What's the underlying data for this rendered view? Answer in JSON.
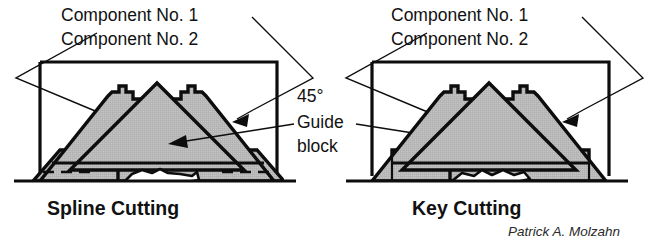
{
  "figure": {
    "background_color": "#ffffff",
    "ink_color": "#0d0d0d",
    "fill_gray": "#b9b9b9",
    "width": 659,
    "height": 244
  },
  "left_diagram": {
    "name": "Spline Cutting",
    "caption": "Spline Cutting",
    "labels": {
      "component_1": "Component No. 1",
      "component_2": "Component No. 2"
    }
  },
  "right_diagram": {
    "name": "Key Cutting",
    "caption": "Key Cutting",
    "labels": {
      "component_1": "Component No. 1",
      "component_2": "Component No. 2"
    }
  },
  "center_callout": {
    "angle": "45°",
    "guide_line_1": "Guide",
    "guide_line_2": "block"
  },
  "credit": {
    "author": "Patrick A. Molzahn"
  }
}
